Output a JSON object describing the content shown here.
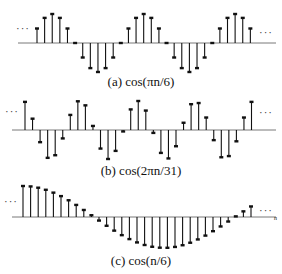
{
  "chart_data": [
    {
      "type": "stem",
      "title": "(a) cos(πn/6)",
      "caption": "(a) cos(πn/6)",
      "xlabel": "n",
      "ylabel": "",
      "ylim": [
        -1,
        1
      ],
      "grid": false,
      "continues_left": true,
      "continues_right": true,
      "x_start_px": 37,
      "x_step_px": 7.62,
      "axis_y_px": 43,
      "amp_px": 29,
      "values": [
        0.5,
        0.866,
        1,
        0.866,
        0.5,
        0,
        -0.5,
        -0.866,
        -1,
        -0.866,
        -0.5,
        0,
        0.5,
        0.866,
        1,
        0.866,
        0.5,
        0,
        -0.5,
        -0.866,
        -1,
        -0.866,
        -0.5,
        0,
        0.5,
        0.866,
        1,
        0.866,
        0.5,
        0
      ]
    },
    {
      "type": "stem",
      "title": "(b) cos(2πn/31)",
      "caption": "(b) cos(2πn/31)",
      "xlabel": "n",
      "ylabel": "",
      "ylim": [
        -1,
        1
      ],
      "grid": false,
      "continues_left": true,
      "continues_right": true,
      "x_start_px": 25,
      "x_step_px": 7.55,
      "axis_y_px": 130,
      "amp_px": 29,
      "values": [
        0.97,
        0.39,
        -0.42,
        -0.96,
        -0.87,
        -0.29,
        0.52,
        0.99,
        0.85,
        0.14,
        -0.64,
        -1.0,
        -0.72,
        -0.05,
        0.71,
        1.0,
        0.67,
        -0.1,
        -0.79,
        -0.98,
        -0.56,
        0.25,
        0.89,
        0.93,
        0.43,
        -0.35,
        -0.94,
        -0.9,
        -0.39,
        0.43,
        0.97
      ]
    },
    {
      "type": "stem",
      "title": "(c) cos(n/6)",
      "caption": "(c) cos(n/6)",
      "xlabel": "n",
      "ylabel": "",
      "ylim": [
        -1,
        1
      ],
      "grid": false,
      "continues_left": true,
      "continues_right": true,
      "x_start_px": 23,
      "x_step_px": 7.6,
      "axis_y_px": 217,
      "amp_px": 31,
      "values": [
        1.0,
        0.986,
        0.945,
        0.878,
        0.786,
        0.674,
        0.54,
        0.39,
        0.227,
        0.057,
        -0.115,
        -0.283,
        -0.44,
        -0.586,
        -0.713,
        -0.82,
        -0.903,
        -0.96,
        -0.99,
        -0.993,
        -0.966,
        -0.911,
        -0.83,
        -0.724,
        -0.6,
        -0.458,
        -0.305,
        -0.146,
        0.02,
        0.182,
        0.34,
        0.49
      ]
    }
  ],
  "captions": {
    "a": "(a) cos(πn/6)",
    "b": "(b) cos(2πn/31)",
    "c": "(c) cos(n/6)"
  },
  "ellipsis": "···",
  "axis_label": "n"
}
